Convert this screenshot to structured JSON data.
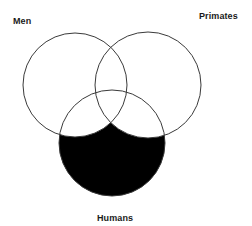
{
  "diagram": {
    "type": "venn",
    "title": "",
    "background_color": "#ffffff",
    "stroke_color": "#3a3a3a",
    "fill_color": "#000000",
    "unshaded_fill": "#ffffff",
    "sets": [
      {
        "key": "men",
        "label": "Men",
        "label_position": "top-left",
        "cx": 75,
        "cy": 85,
        "r": 52,
        "shaded": false
      },
      {
        "key": "primates",
        "label": "Primates",
        "label_position": "top-right",
        "cx": 148,
        "cy": 85,
        "r": 53,
        "shaded": false
      },
      {
        "key": "humans",
        "label": "Humans",
        "label_position": "bottom-center",
        "cx": 112,
        "cy": 143,
        "r": 53,
        "shaded": true
      }
    ],
    "shaded_region_description": "Humans only (Humans minus Men minus Primates)"
  }
}
